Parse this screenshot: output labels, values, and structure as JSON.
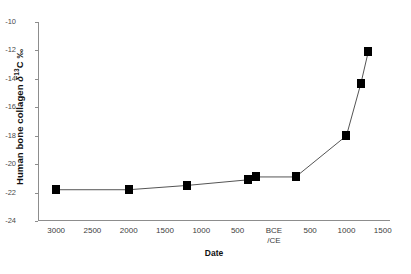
{
  "chart_data": {
    "type": "line",
    "title": "",
    "xlabel": "Date",
    "ylabel": "Human bone collagen δ13C ‰",
    "ylabel_parts": {
      "prefix": "Human bone collagen ",
      "delta": "δ",
      "sup": "13",
      "suffix": "C  ‰"
    },
    "xlim": [
      -3250,
      1600
    ],
    "ylim": [
      -24,
      -10
    ],
    "grid": false,
    "legend": "none",
    "marker": "filled-square",
    "line_color": "#555555",
    "marker_color": "#000000",
    "axis_color": "#8d8d8d",
    "x_tick_values": [
      -3000,
      -2500,
      -2000,
      -1500,
      -1000,
      -500,
      0,
      500,
      1000,
      1500
    ],
    "x_tick_labels": [
      "3000",
      "2500",
      "2000",
      "1500",
      "1000",
      "500",
      "BCE\n/CE",
      "500",
      "1000",
      "1500"
    ],
    "y_tick_values": [
      -10,
      -12,
      -14,
      -16,
      -18,
      -20,
      -22,
      -24
    ],
    "y_tick_labels": [
      "-10",
      "-12",
      "-14",
      "-16",
      "-18",
      "-20",
      "-22",
      "-24"
    ],
    "series": [
      {
        "name": "Human bone collagen δ13C",
        "x": [
          -3000,
          -2000,
          -1200,
          -350,
          -250,
          300,
          1000,
          1200,
          1300
        ],
        "y": [
          -21.8,
          -21.8,
          -21.5,
          -21.1,
          -20.9,
          -20.9,
          -18.0,
          -14.3,
          -12.1
        ]
      }
    ]
  }
}
